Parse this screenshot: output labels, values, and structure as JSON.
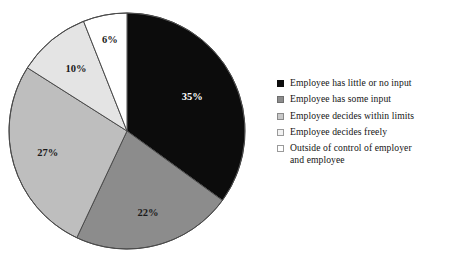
{
  "chart_data": {
    "type": "pie",
    "title": "",
    "subtitle": "",
    "xlabel": "",
    "ylabel": "",
    "legend_position": "right",
    "grid": false,
    "start_angle_deg": 0,
    "direction": "clockwise",
    "categories": [
      "Employee has little or no input",
      "Employee has some input",
      "Employee decides within limits",
      "Employee decides freely",
      "Outside of control of employer and employee"
    ],
    "values": [
      35,
      22,
      27,
      10,
      6
    ],
    "data_labels": [
      "35%",
      "22%",
      "27%",
      "10%",
      "6%"
    ],
    "colors": [
      "#0c0c0c",
      "#8c8c8c",
      "#bebebe",
      "#e4e4e4",
      "#ffffff"
    ],
    "label_text_colors": [
      "#ffffff",
      "#1a1a1a",
      "#1a1a1a",
      "#1a1a1a",
      "#1a1a1a"
    ],
    "slices": [
      {
        "label": "Employee has little or no input",
        "value": 35,
        "data_label": "35%",
        "color": "#0c0c0c",
        "label_color": "#ffffff"
      },
      {
        "label": "Employee has some input",
        "value": 22,
        "data_label": "22%",
        "color": "#8c8c8c",
        "label_color": "#1a1a1a"
      },
      {
        "label": "Employee decides within limits",
        "value": 27,
        "data_label": "27%",
        "color": "#bebebe",
        "label_color": "#1a1a1a"
      },
      {
        "label": "Employee decides freely",
        "value": 10,
        "data_label": "10%",
        "color": "#e4e4e4",
        "label_color": "#1a1a1a"
      },
      {
        "label": "Outside of control of employer and employee",
        "value": 6,
        "data_label": "6%",
        "color": "#ffffff",
        "label_color": "#1a1a1a"
      }
    ]
  },
  "legend": {
    "items": [
      {
        "label": "Employee has little or no input",
        "color": "#0c0c0c",
        "border": "#0c0c0c"
      },
      {
        "label": "Employee has some input",
        "color": "#8c8c8c",
        "border": "#6e6e6e"
      },
      {
        "label": "Employee decides within limits",
        "color": "#c9c9c9",
        "border": "#8a8a8a"
      },
      {
        "label": "Employee decides freely",
        "color": "#f2f2f2",
        "border": "#9a9a9a"
      },
      {
        "label": "Outside of control of employer\nand employee",
        "color": "#ffffff",
        "border": "#9a9a9a"
      }
    ]
  },
  "geometry": {
    "center_x": 127,
    "center_y": 131,
    "radius": 118,
    "outline_color": "#4a4a4a"
  }
}
